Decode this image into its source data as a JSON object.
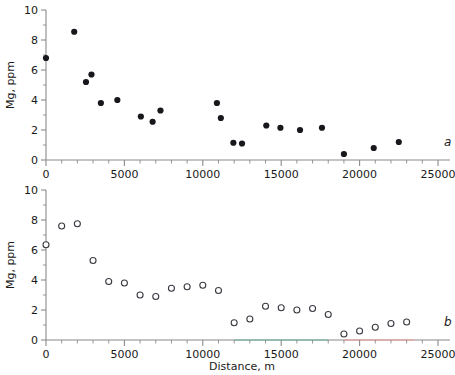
{
  "figure": {
    "clipped_header_text": "",
    "x_axis_title": "Distance, m",
    "y_axis_title": "Mg, ppm",
    "panel_a_label": "a",
    "panel_b_label": "b"
  },
  "axes": {
    "x_ticks": [
      "0",
      "5000",
      "10000",
      "15000",
      "20000",
      "25000"
    ],
    "y_ticks": [
      "0",
      "2",
      "4",
      "6",
      "8",
      "10"
    ],
    "x_min": 0,
    "x_max": 25000,
    "y_min": 0,
    "y_max": 10,
    "x_major_step": 5000,
    "x_minor_step": 1000,
    "y_major_step": 2,
    "y_minor_step": 1
  },
  "colors": {
    "marker_filled": "#17171c",
    "marker_open_stroke": "#3a3a42",
    "axis": "#8a8a8a",
    "baseline_teal": "#7fb7a6",
    "baseline_pink": "#e8a7a0",
    "text": "#1a1a1a"
  },
  "baseline_segments": [
    {
      "panel": "b",
      "from": 12000,
      "to": 18000,
      "color": "#7fb7a6"
    },
    {
      "panel": "b",
      "from": 19000,
      "to": 23500,
      "color": "#e8a7a0"
    }
  ],
  "chart_data": [
    {
      "type": "scatter",
      "panel": "a",
      "title": "",
      "xlabel": "Distance, m",
      "ylabel": "Mg, ppm",
      "xlim": [
        0,
        25000
      ],
      "ylim": [
        0,
        10
      ],
      "grid": false,
      "legend": "none",
      "marker": "filled-circle",
      "series": [
        {
          "name": "Mg measured",
          "points": [
            {
              "x": 0,
              "y": 6.8
            },
            {
              "x": 1800,
              "y": 8.55
            },
            {
              "x": 2550,
              "y": 5.2
            },
            {
              "x": 2900,
              "y": 5.7
            },
            {
              "x": 3500,
              "y": 3.8
            },
            {
              "x": 4550,
              "y": 4.0
            },
            {
              "x": 6050,
              "y": 2.9
            },
            {
              "x": 6800,
              "y": 2.55
            },
            {
              "x": 7300,
              "y": 3.3
            },
            {
              "x": 10900,
              "y": 3.8
            },
            {
              "x": 11150,
              "y": 2.8
            },
            {
              "x": 11950,
              "y": 1.15
            },
            {
              "x": 12500,
              "y": 1.1
            },
            {
              "x": 14050,
              "y": 2.3
            },
            {
              "x": 14950,
              "y": 2.15
            },
            {
              "x": 16200,
              "y": 2.0
            },
            {
              "x": 17600,
              "y": 2.15
            },
            {
              "x": 19000,
              "y": 0.4
            },
            {
              "x": 20900,
              "y": 0.8
            },
            {
              "x": 22500,
              "y": 1.2
            }
          ]
        }
      ]
    },
    {
      "type": "scatter",
      "panel": "b",
      "title": "",
      "xlabel": "Distance, m",
      "ylabel": "Mg, ppm",
      "xlim": [
        0,
        25000
      ],
      "ylim": [
        0,
        10
      ],
      "grid": false,
      "legend": "none",
      "marker": "open-circle",
      "series": [
        {
          "name": "Mg modeled",
          "points": [
            {
              "x": 0,
              "y": 6.35
            },
            {
              "x": 1000,
              "y": 7.6
            },
            {
              "x": 2000,
              "y": 7.75
            },
            {
              "x": 3000,
              "y": 5.3
            },
            {
              "x": 4000,
              "y": 3.9
            },
            {
              "x": 5000,
              "y": 3.8
            },
            {
              "x": 6000,
              "y": 3.0
            },
            {
              "x": 7000,
              "y": 2.9
            },
            {
              "x": 8000,
              "y": 3.45
            },
            {
              "x": 9000,
              "y": 3.55
            },
            {
              "x": 10000,
              "y": 3.65
            },
            {
              "x": 11000,
              "y": 3.3
            },
            {
              "x": 12000,
              "y": 1.15
            },
            {
              "x": 13000,
              "y": 1.4
            },
            {
              "x": 14000,
              "y": 2.25
            },
            {
              "x": 15000,
              "y": 2.15
            },
            {
              "x": 16000,
              "y": 2.0
            },
            {
              "x": 17000,
              "y": 2.1
            },
            {
              "x": 18000,
              "y": 1.7
            },
            {
              "x": 19000,
              "y": 0.4
            },
            {
              "x": 20000,
              "y": 0.6
            },
            {
              "x": 21000,
              "y": 0.85
            },
            {
              "x": 22000,
              "y": 1.1
            },
            {
              "x": 23000,
              "y": 1.2
            }
          ]
        }
      ]
    }
  ]
}
